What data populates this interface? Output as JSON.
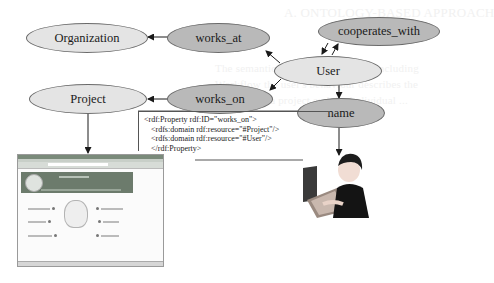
{
  "background_text": [
    "A. ONTOLOGY-BASED APPROACH",
    "The semantic foundation ontology including",
    "Workflow the user's behaviour describes the",
    "relations of a project and the individual ..."
  ],
  "nodes": {
    "organization": "Organization",
    "works_at": "works_at",
    "cooperates_with": "cooperates_with",
    "user": "User",
    "project": "Project",
    "works_on": "works_on",
    "name": "name"
  },
  "code_snippet": {
    "line1": "<rdf:Property rdf:ID=\"works_on\">",
    "line2": "<rdfs:domain rdf:resource=\"#Project\"/>",
    "line3": "<rdfs:domain rdf:resource=\"#User\"/>",
    "line4": "</rdf:Property>"
  },
  "colors": {
    "class_node_fill": "#e4e4e4",
    "property_node_fill": "#b9b9b9",
    "edge": "#1a1a1a"
  },
  "images": {
    "project_screenshot": "web-portal-screenshot",
    "user_figure": "person-at-computer"
  }
}
